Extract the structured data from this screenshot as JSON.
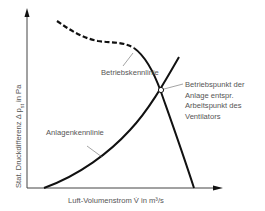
{
  "diagram": {
    "type": "fan-characteristic-diagram",
    "axes": {
      "y_label_prefix": "Stat. Druckdifferenz Δ p",
      "y_label_subscript": "st",
      "y_label_suffix": " in Pa",
      "x_label": "Luft-Volumenstrom V̇ in m³/s"
    },
    "curves": {
      "fan_curve": {
        "label": "Betriebskennlinie",
        "style": "dashed-then-solid",
        "color": "#111111"
      },
      "system_curve": {
        "label": "Anlagenkennlinie",
        "style": "solid",
        "color": "#111111"
      }
    },
    "operating_point": {
      "label_lines": [
        "Betriebspunkt der",
        "Anlage entspr.",
        "Arbeitspunkt des",
        "Ventilators"
      ],
      "marker": "open-circle"
    }
  }
}
